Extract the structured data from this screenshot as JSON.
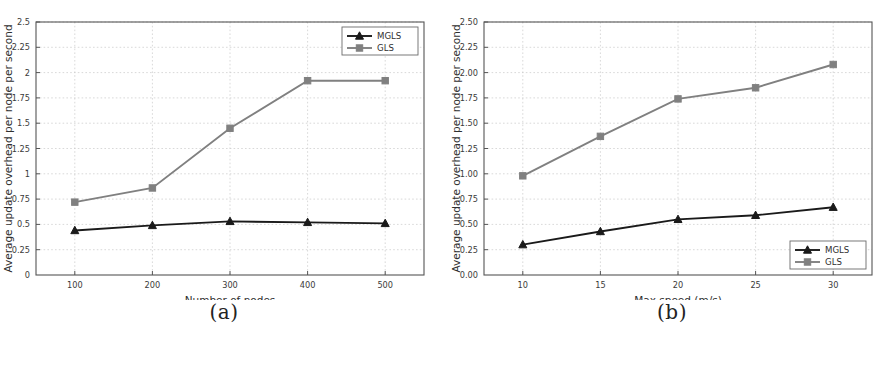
{
  "figure": {
    "subfigures": [
      {
        "caption": "(a)",
        "chart_data": {
          "type": "line",
          "title": "",
          "xlabel": "Number of nodes",
          "ylabel": "Average update overhead per node per second",
          "x": [
            100,
            200,
            300,
            400,
            500
          ],
          "xtick_labels": [
            "100",
            "200",
            "300",
            "400",
            "500"
          ],
          "xlim": [
            50,
            550
          ],
          "ylim": [
            0,
            2.5
          ],
          "yticks": [
            0,
            0.25,
            0.5,
            0.75,
            1,
            1.25,
            1.5,
            1.75,
            2,
            2.25,
            2.5
          ],
          "ytick_labels": [
            "0",
            "0.25",
            "0.5",
            "0.75",
            "1",
            "1.25",
            "1.5",
            "1.75",
            "2",
            "2.25",
            "2.5"
          ],
          "grid": true,
          "legend_position": "top-right",
          "series": [
            {
              "name": "MGLS",
              "color": "#1a1a1a",
              "marker": "triangle",
              "values": [
                0.44,
                0.49,
                0.53,
                0.52,
                0.51
              ]
            },
            {
              "name": "GLS",
              "color": "#808080",
              "marker": "square",
              "values": [
                0.72,
                0.86,
                1.45,
                1.92,
                1.92
              ]
            }
          ]
        }
      },
      {
        "caption": "(b)",
        "chart_data": {
          "type": "line",
          "title": "",
          "xlabel": "Max speed (m/s)",
          "ylabel": "Average update overhead per node per second",
          "x": [
            10,
            15,
            20,
            25,
            30
          ],
          "xtick_labels": [
            "10",
            "15",
            "20",
            "25",
            "30"
          ],
          "xlim": [
            7.5,
            32.5
          ],
          "ylim": [
            0,
            2.5
          ],
          "yticks": [
            0,
            0.25,
            0.5,
            0.75,
            1,
            1.25,
            1.5,
            1.75,
            2,
            2.25,
            2.5
          ],
          "ytick_labels": [
            "0.00",
            "0.25",
            "0.50",
            "0.75",
            "1.00",
            "1.25",
            "1.50",
            "1.75",
            "2.00",
            "2.25",
            "2.50"
          ],
          "grid": true,
          "legend_position": "bottom-right",
          "series": [
            {
              "name": "MGLS",
              "color": "#1a1a1a",
              "marker": "triangle",
              "values": [
                0.3,
                0.43,
                0.55,
                0.59,
                0.67
              ]
            },
            {
              "name": "GLS",
              "color": "#808080",
              "marker": "square",
              "values": [
                0.98,
                1.37,
                1.74,
                1.85,
                2.08
              ]
            }
          ]
        }
      }
    ]
  }
}
